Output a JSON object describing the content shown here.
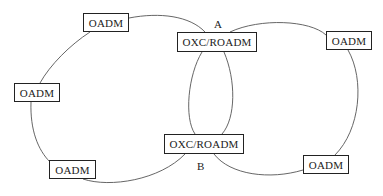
{
  "diagram": {
    "nodes": [
      {
        "id": "oadm-top-left",
        "label": "OADM"
      },
      {
        "id": "oadm-left",
        "label": "OADM"
      },
      {
        "id": "oadm-bottom-left",
        "label": "OADM"
      },
      {
        "id": "oxc-a",
        "label": "OXC/ROADM"
      },
      {
        "id": "oxc-b",
        "label": "OXC/ROADM"
      },
      {
        "id": "oadm-right",
        "label": "OADM"
      },
      {
        "id": "oadm-bottom-right",
        "label": "OADM"
      }
    ],
    "node_labels": {
      "a": "A",
      "b": "B"
    },
    "rings": [
      {
        "name": "left-ring",
        "members": [
          "oadm-top-left",
          "oxc-a",
          "oxc-b",
          "oadm-bottom-left",
          "oadm-left"
        ]
      },
      {
        "name": "right-ring",
        "members": [
          "oxc-a",
          "oadm-right",
          "oadm-bottom-right",
          "oxc-b"
        ]
      }
    ],
    "colors": {
      "line": "#555555",
      "border": "#222222",
      "text": "#222222"
    }
  }
}
